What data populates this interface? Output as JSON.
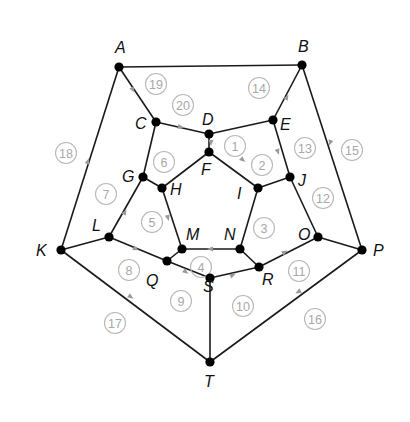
{
  "diagram": {
    "title": "",
    "style": {
      "edge_color": "#1a1a1a",
      "vertex_color": "#000000",
      "label_color": "#111111",
      "face_number_color": "#a8a8a8",
      "arrow_color": "#9a9a9a"
    },
    "vertices": [
      {
        "id": "A",
        "x": 119,
        "y": 67,
        "lx": 115,
        "ly": 53
      },
      {
        "id": "B",
        "x": 302,
        "y": 65,
        "lx": 298,
        "ly": 52
      },
      {
        "id": "C",
        "x": 156,
        "y": 122,
        "lx": 135,
        "ly": 129
      },
      {
        "id": "D",
        "x": 209,
        "y": 134,
        "lx": 202,
        "ly": 125
      },
      {
        "id": "E",
        "x": 273,
        "y": 120,
        "lx": 280,
        "ly": 130
      },
      {
        "id": "F",
        "x": 209,
        "y": 152,
        "lx": 201,
        "ly": 175
      },
      {
        "id": "G",
        "x": 143,
        "y": 177,
        "lx": 122,
        "ly": 182
      },
      {
        "id": "H",
        "x": 162,
        "y": 188,
        "lx": 170,
        "ly": 195
      },
      {
        "id": "I",
        "x": 258,
        "y": 188,
        "lx": 237,
        "ly": 199
      },
      {
        "id": "J",
        "x": 290,
        "y": 177,
        "lx": 298,
        "ly": 186
      },
      {
        "id": "K",
        "x": 61,
        "y": 250,
        "lx": 36,
        "ly": 256
      },
      {
        "id": "L",
        "x": 109,
        "y": 237,
        "lx": 92,
        "ly": 231
      },
      {
        "id": "M",
        "x": 182,
        "y": 249,
        "lx": 186,
        "ly": 240
      },
      {
        "id": "N",
        "x": 240,
        "y": 249,
        "lx": 224,
        "ly": 240
      },
      {
        "id": "O",
        "x": 318,
        "y": 237,
        "lx": 298,
        "ly": 240
      },
      {
        "id": "P",
        "x": 362,
        "y": 250,
        "lx": 373,
        "ly": 256
      },
      {
        "id": "Q",
        "x": 167,
        "y": 261,
        "lx": 146,
        "ly": 286
      },
      {
        "id": "R",
        "x": 259,
        "y": 267,
        "lx": 262,
        "ly": 285
      },
      {
        "id": "S",
        "x": 210,
        "y": 278,
        "lx": 203,
        "ly": 292
      },
      {
        "id": "T",
        "x": 210,
        "y": 362,
        "lx": 204,
        "ly": 387
      }
    ],
    "edges": [
      [
        "A",
        "B"
      ],
      [
        "A",
        "C"
      ],
      [
        "A",
        "K"
      ],
      [
        "B",
        "E"
      ],
      [
        "B",
        "P"
      ],
      [
        "C",
        "D"
      ],
      [
        "C",
        "G"
      ],
      [
        "D",
        "E"
      ],
      [
        "D",
        "F"
      ],
      [
        "E",
        "J"
      ],
      [
        "F",
        "H"
      ],
      [
        "F",
        "I"
      ],
      [
        "G",
        "H"
      ],
      [
        "G",
        "L"
      ],
      [
        "H",
        "M"
      ],
      [
        "I",
        "J"
      ],
      [
        "I",
        "N"
      ],
      [
        "J",
        "O"
      ],
      [
        "K",
        "L"
      ],
      [
        "K",
        "T"
      ],
      [
        "L",
        "Q"
      ],
      [
        "M",
        "N"
      ],
      [
        "M",
        "Q"
      ],
      [
        "N",
        "R"
      ],
      [
        "O",
        "P"
      ],
      [
        "O",
        "R"
      ],
      [
        "P",
        "T"
      ],
      [
        "Q",
        "S"
      ],
      [
        "R",
        "S"
      ],
      [
        "S",
        "T"
      ]
    ],
    "face_numbers": [
      {
        "n": "1",
        "x": 235,
        "y": 146
      },
      {
        "n": "2",
        "x": 262,
        "y": 165
      },
      {
        "n": "3",
        "x": 264,
        "y": 228
      },
      {
        "n": "4",
        "x": 201,
        "y": 267
      },
      {
        "n": "5",
        "x": 152,
        "y": 222
      },
      {
        "n": "6",
        "x": 164,
        "y": 162
      },
      {
        "n": "7",
        "x": 106,
        "y": 194
      },
      {
        "n": "8",
        "x": 129,
        "y": 270
      },
      {
        "n": "9",
        "x": 181,
        "y": 301
      },
      {
        "n": "10",
        "x": 243,
        "y": 306
      },
      {
        "n": "11",
        "x": 299,
        "y": 271
      },
      {
        "n": "12",
        "x": 323,
        "y": 198
      },
      {
        "n": "13",
        "x": 305,
        "y": 148
      },
      {
        "n": "14",
        "x": 259,
        "y": 88
      },
      {
        "n": "15",
        "x": 352,
        "y": 150
      },
      {
        "n": "16",
        "x": 315,
        "y": 319
      },
      {
        "n": "17",
        "x": 115,
        "y": 323
      },
      {
        "n": "18",
        "x": 66,
        "y": 153
      },
      {
        "n": "19",
        "x": 156,
        "y": 84
      },
      {
        "n": "20",
        "x": 183,
        "y": 105
      }
    ],
    "arrows": [
      {
        "x": 133,
        "y": 90,
        "rot": 60
      },
      {
        "x": 181,
        "y": 127,
        "rot": 10
      },
      {
        "x": 287,
        "y": 97,
        "rot": -60
      },
      {
        "x": 278,
        "y": 152,
        "rot": 70
      },
      {
        "x": 330,
        "y": 143,
        "rot": 110
      },
      {
        "x": 88,
        "y": 161,
        "rot": -70
      },
      {
        "x": 125,
        "y": 212,
        "rot": -60
      },
      {
        "x": 168,
        "y": 218,
        "rot": 75
      },
      {
        "x": 136,
        "y": 249,
        "rot": 25
      },
      {
        "x": 186,
        "y": 272,
        "rot": 35
      },
      {
        "x": 233,
        "y": 275,
        "rot": -25
      },
      {
        "x": 210,
        "y": 249,
        "rot": 180
      },
      {
        "x": 285,
        "y": 252,
        "rot": -30
      },
      {
        "x": 298,
        "y": 292,
        "rot": 150
      },
      {
        "x": 131,
        "y": 297,
        "rot": 35
      },
      {
        "x": 243,
        "y": 160,
        "rot": 40
      },
      {
        "x": 211,
        "y": 143,
        "rot": 90
      }
    ]
  }
}
